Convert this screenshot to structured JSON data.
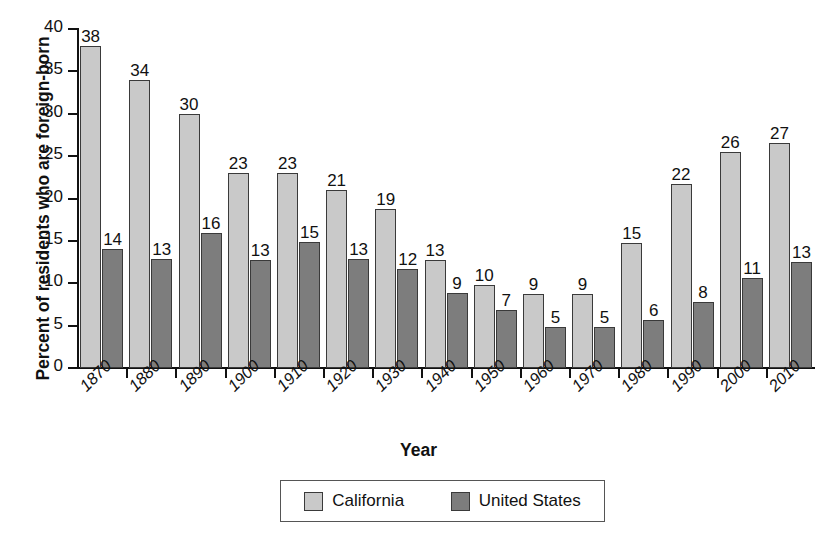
{
  "chart_data": {
    "type": "bar",
    "title": "",
    "xlabel": "Year",
    "ylabel": "Percent of residents who are foreign-born",
    "categories": [
      "1870",
      "1880",
      "1890",
      "1900",
      "1910",
      "1920",
      "1930",
      "1940",
      "1950",
      "1960",
      "1970",
      "1980",
      "1990",
      "2000",
      "2010"
    ],
    "series": [
      {
        "name": "California",
        "color": "#c9c9c9",
        "values": [
          38,
          34,
          30,
          23,
          23,
          21,
          19,
          13,
          10,
          9,
          9,
          15,
          22,
          26,
          27
        ],
        "plotted": [
          38.0,
          34.0,
          30.0,
          23.0,
          23.0,
          21.0,
          18.8,
          12.7,
          9.8,
          8.7,
          8.7,
          14.8,
          21.7,
          25.5,
          26.6
        ]
      },
      {
        "name": "United States",
        "color": "#7d7d7d",
        "values": [
          14,
          13,
          16,
          13,
          15,
          13,
          12,
          9,
          7,
          5,
          5,
          6,
          8,
          11,
          13
        ],
        "plotted": [
          14.0,
          12.9,
          15.9,
          12.8,
          14.9,
          12.9,
          11.7,
          8.8,
          6.9,
          4.8,
          4.8,
          5.7,
          7.8,
          10.6,
          12.5
        ]
      }
    ],
    "ylim": [
      0,
      40
    ],
    "yticks": [
      0,
      5,
      10,
      15,
      20,
      25,
      30,
      35,
      40
    ],
    "ytick_labels": [
      "0",
      "5",
      "10",
      "15",
      "20",
      "25",
      "30",
      "35",
      "40"
    ],
    "grid": false,
    "legend_position": "bottom-center",
    "xtick_label_rotation": -45
  },
  "legend": {
    "items": [
      {
        "label": "California",
        "color": "#c9c9c9"
      },
      {
        "label": "United States",
        "color": "#7d7d7d"
      }
    ]
  }
}
